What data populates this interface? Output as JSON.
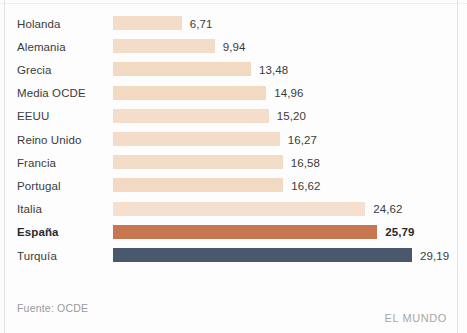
{
  "chart_data": {
    "type": "bar",
    "orientation": "horizontal",
    "title": "",
    "subtitle": "",
    "xlabel": "",
    "ylabel": "",
    "grid": false,
    "legend": null,
    "xlim": [
      0,
      29.19
    ],
    "categories": [
      "Holanda",
      "Alemania",
      "Grecia",
      "Media OCDE",
      "EEUU",
      "Reino Unido",
      "Francia",
      "Portugal",
      "Italia",
      "España",
      "Turquía"
    ],
    "values": [
      6.71,
      9.94,
      13.48,
      14.96,
      15.2,
      16.27,
      16.58,
      16.62,
      24.62,
      25.79,
      29.19
    ],
    "value_labels": [
      "6,71",
      "9,94",
      "13,48",
      "14,96",
      "15,20",
      "16,27",
      "16,58",
      "16,62",
      "24,62",
      "25,79",
      "29,19"
    ],
    "bar_colors": [
      "#f3dcc8",
      "#f3dcc8",
      "#f2d9c2",
      "#f2d9c2",
      "#f4ddcb",
      "#f3dcc8",
      "#f3dcc8",
      "#f2d9c2",
      "#f5e0cf",
      "#c8764f",
      "#4a586e"
    ],
    "highlight_index": 9,
    "rows": [
      {
        "label": "Holanda",
        "value": 6.71,
        "value_label": "6,71",
        "color": "#f3dcc8",
        "highlight": false
      },
      {
        "label": "Alemania",
        "value": 9.94,
        "value_label": "9,94",
        "color": "#f3dcc8",
        "highlight": false
      },
      {
        "label": "Grecia",
        "value": 13.48,
        "value_label": "13,48",
        "color": "#f2d9c2",
        "highlight": false
      },
      {
        "label": "Media OCDE",
        "value": 14.96,
        "value_label": "14,96",
        "color": "#f2d9c2",
        "highlight": false
      },
      {
        "label": "EEUU",
        "value": 15.2,
        "value_label": "15,20",
        "color": "#f4ddcb",
        "highlight": false
      },
      {
        "label": "Reino Unido",
        "value": 16.27,
        "value_label": "16,27",
        "color": "#f3dcc8",
        "highlight": false
      },
      {
        "label": "Francia",
        "value": 16.58,
        "value_label": "16,58",
        "color": "#f3dcc8",
        "highlight": false
      },
      {
        "label": "Portugal",
        "value": 16.62,
        "value_label": "16,62",
        "color": "#f2d9c2",
        "highlight": false
      },
      {
        "label": "Italia",
        "value": 24.62,
        "value_label": "24,62",
        "color": "#f5e0cf",
        "highlight": false
      },
      {
        "label": "España",
        "value": 25.79,
        "value_label": "25,79",
        "color": "#c8764f",
        "highlight": true
      },
      {
        "label": "Turquía",
        "value": 29.19,
        "value_label": "29,19",
        "color": "#4a586e",
        "highlight": false
      }
    ]
  },
  "footer": {
    "source": "Fuente: OCDE",
    "brand": "EL MUNDO"
  },
  "colors": {
    "bar_light": "#f3dcc8",
    "bar_highlight": "#c8764f",
    "bar_dark": "#4a586e",
    "text": "#3b3b3b",
    "muted": "#9a9a9a",
    "background": "#fdfdfd"
  }
}
